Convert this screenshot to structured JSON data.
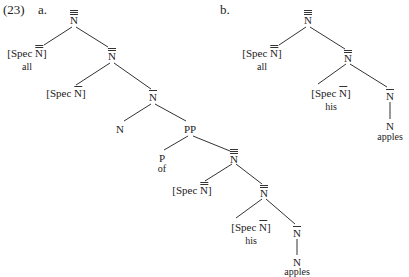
{
  "example_number": "(23)",
  "trees": [
    {
      "label": "a.",
      "nodes": {
        "root": {
          "cat": "N",
          "bars": 3
        },
        "spec1": {
          "prefix": "[Spec ",
          "cat": "N",
          "bars": 2,
          "suffix": "]",
          "word": "all"
        },
        "n2": {
          "cat": "N",
          "bars": 2
        },
        "spec2": {
          "prefix": "[Spec ",
          "cat": "N",
          "bars": 1,
          "suffix": "]"
        },
        "n1": {
          "cat": "N",
          "bars": 1
        },
        "head": {
          "cat": "N"
        },
        "pp": {
          "cat": "PP"
        },
        "p": {
          "cat": "P",
          "word": "of"
        },
        "n3b": {
          "cat": "N",
          "bars": 3
        },
        "spec3": {
          "prefix": "[Spec ",
          "cat": "N",
          "bars": 2,
          "suffix": "]"
        },
        "n2b": {
          "cat": "N",
          "bars": 2
        },
        "spec4": {
          "prefix": "[Spec ",
          "cat": "N",
          "bars": 1,
          "suffix": "]",
          "word": "his"
        },
        "n1b": {
          "cat": "N",
          "bars": 1
        },
        "n0": {
          "cat": "N",
          "word": "apples"
        }
      }
    },
    {
      "label": "b.",
      "nodes": {
        "root": {
          "cat": "N",
          "bars": 3
        },
        "spec1": {
          "prefix": "[Spec ",
          "cat": "N",
          "bars": 2,
          "suffix": "]",
          "word": "all"
        },
        "n2": {
          "cat": "N",
          "bars": 2
        },
        "spec2": {
          "prefix": "[Spec ",
          "cat": "N",
          "bars": 1,
          "suffix": "]",
          "word": "his"
        },
        "n1": {
          "cat": "N",
          "bars": 1
        },
        "n0": {
          "cat": "N",
          "word": "apples"
        }
      }
    }
  ]
}
